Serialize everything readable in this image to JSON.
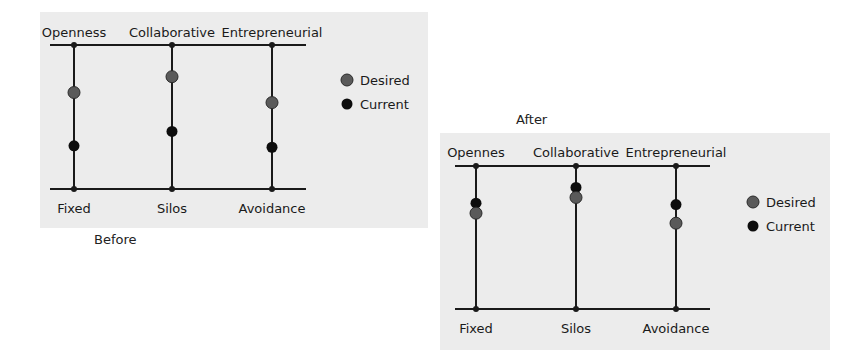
{
  "colors": {
    "desired": "#5a5a5a",
    "current": "#0d0d0d",
    "line": "#1a1a1a",
    "panel_bg": "#ececec"
  },
  "legend": {
    "desired_label": "Desired",
    "current_label": "Current"
  },
  "before": {
    "caption": "Before",
    "axes": [
      {
        "top_label": "Openness",
        "bottom_label": "Fixed",
        "desired": 67,
        "current": 30
      },
      {
        "top_label": "Collaborative",
        "bottom_label": "Silos",
        "desired": 78,
        "current": 40
      },
      {
        "top_label": "Entrepreneurial",
        "bottom_label": "Avoidance",
        "desired": 60,
        "current": 29
      }
    ]
  },
  "after": {
    "caption": "After",
    "axes": [
      {
        "top_label": "Opennes",
        "bottom_label": "Fixed",
        "desired": 67,
        "current": 74
      },
      {
        "top_label": "Collaborative",
        "bottom_label": "Silos",
        "desired": 78,
        "current": 85
      },
      {
        "top_label": "Entrepreneurial",
        "bottom_label": "Avoidance",
        "desired": 60,
        "current": 73
      }
    ]
  }
}
